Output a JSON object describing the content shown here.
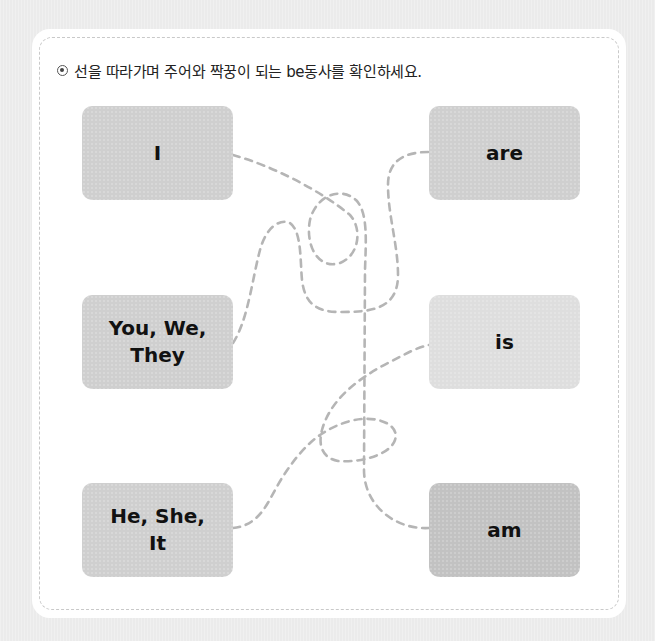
{
  "instruction": {
    "bullet_icon": "radio-bullet-icon",
    "text": "선을 따라가며 주어와 짝꿍이 되는 be동사를 확인하세요."
  },
  "subjects": [
    {
      "label": "I"
    },
    {
      "label": "You, We,\nThey"
    },
    {
      "label": "He, She,\nIt"
    }
  ],
  "verbs": [
    {
      "label": "are"
    },
    {
      "label": "is"
    },
    {
      "label": "am"
    }
  ],
  "connections": [
    {
      "from": "I",
      "to": "am"
    },
    {
      "from": "You, We, They",
      "to": "are"
    },
    {
      "from": "He, She, It",
      "to": "is"
    }
  ],
  "colors": {
    "box": "#cfcfcf",
    "box_light": "#dedede",
    "box_dark": "#c2c2c2",
    "dash_line": "#b5b5b5",
    "card": "#ffffff",
    "background": "#ebebeb"
  }
}
